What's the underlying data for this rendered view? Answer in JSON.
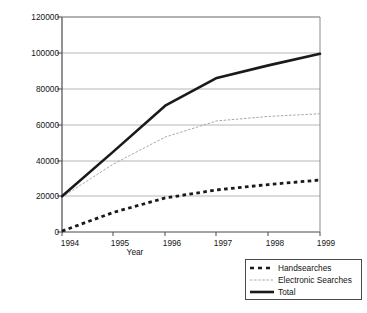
{
  "chart_data": {
    "type": "line",
    "title": "",
    "xlabel": "Year",
    "ylabel": "No of reports submitted",
    "categories": [
      "1994",
      "1995",
      "1996",
      "1997",
      "1998",
      "1999"
    ],
    "x": [
      1994,
      1995,
      1996,
      1997,
      1998,
      1999
    ],
    "xlim": [
      1994,
      1999
    ],
    "ylim": [
      0,
      120000
    ],
    "yticks": [
      "0",
      "20000",
      "40000",
      "60000",
      "80000",
      "100000",
      "120000"
    ],
    "ytick_values": [
      0,
      20000,
      40000,
      60000,
      80000,
      100000,
      120000
    ],
    "grid": "horizontal",
    "legend_position": "bottom-right",
    "series": [
      {
        "name": "Handsearches",
        "style": "dashed",
        "color": "#1a1a1a",
        "values": [
          500,
          11000,
          19000,
          23500,
          26500,
          29000
        ]
      },
      {
        "name": "Electronic Searches",
        "style": "thin-dotted",
        "color": "#a8a8a8",
        "values": [
          19500,
          38000,
          53000,
          62000,
          64500,
          66000
        ]
      },
      {
        "name": "Total",
        "style": "solid-thick",
        "color": "#1a1a1a",
        "values": [
          20000,
          45000,
          70500,
          86000,
          93000,
          99500
        ]
      }
    ]
  },
  "axes": {
    "ytick_0": "0",
    "ytick_1": "20000",
    "ytick_2": "40000",
    "ytick_3": "60000",
    "ytick_4": "80000",
    "ytick_5": "100000",
    "ytick_6": "120000",
    "xtick_0": "1994",
    "xtick_1": "1995",
    "xtick_2": "1996",
    "xtick_3": "1997",
    "xtick_4": "1998",
    "xtick_5": "1999",
    "xlabel": "Year",
    "ylabel": "No of reports submitted"
  },
  "legend": {
    "items": [
      {
        "label": "Handsearches"
      },
      {
        "label": "Electronic Searches"
      },
      {
        "label": "Total"
      }
    ]
  }
}
